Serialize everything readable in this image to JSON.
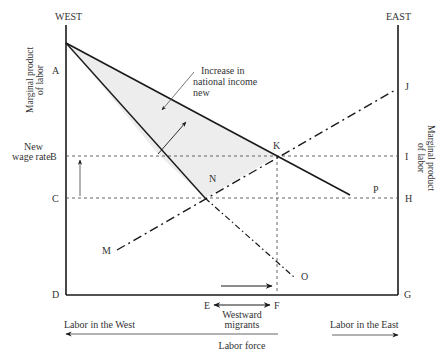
{
  "axes": {
    "left_header": "WEST",
    "right_header": "EAST",
    "left_ylabel_line1": "Marginal product",
    "left_ylabel_line2": "of labor",
    "right_ylabel_line1": "Marginal product",
    "right_ylabel_line2": "of labor"
  },
  "points": {
    "A": "A",
    "B": "B",
    "C": "C",
    "D": "D",
    "E": "E",
    "F": "F",
    "G": "G",
    "H": "H",
    "I": "I",
    "J": "J",
    "K": "K",
    "M": "M",
    "N": "N",
    "O": "O",
    "P": "P"
  },
  "annotations": {
    "new_wage_line1": "New",
    "new_wage_line2": "wage rate",
    "increase_line1": "Increase in",
    "increase_line2": "national income",
    "increase_line3": "new",
    "migrants_line1": "Westward",
    "migrants_line2": "migrants",
    "labor_west": "Labor in the West",
    "labor_east": "Labor in the East",
    "labor_force": "Labor force"
  },
  "colors": {
    "line": "#1a1a1a",
    "dashed": "#555555",
    "shade": "#ededed",
    "text": "#333333"
  }
}
